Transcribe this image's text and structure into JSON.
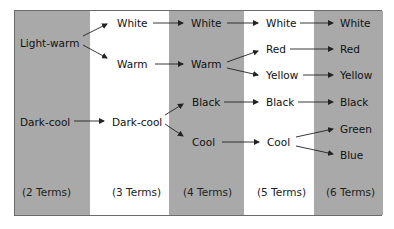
{
  "diagram": {
    "columns": [
      {
        "term_label": "(2 Terms)",
        "nodes": [
          "Light-warm",
          "Dark-cool"
        ]
      },
      {
        "term_label": "(3 Terms)",
        "nodes": [
          "White",
          "Warm",
          "Dark-cool"
        ]
      },
      {
        "term_label": "(4 Terms)",
        "nodes": [
          "White",
          "Warm",
          "Black",
          "Cool"
        ]
      },
      {
        "term_label": "(5 Terms)",
        "nodes": [
          "White",
          "Red",
          "Yellow",
          "Black",
          "Cool"
        ]
      },
      {
        "term_label": "(6 Terms)",
        "nodes": [
          "White",
          "Red",
          "Yellow",
          "Black",
          "Green",
          "Blue"
        ]
      }
    ],
    "colors": {
      "shaded_column": "#a9a9a9",
      "unshaded_column": "#ffffff",
      "border": "#6a6a6a",
      "arrow": "#222222"
    }
  }
}
